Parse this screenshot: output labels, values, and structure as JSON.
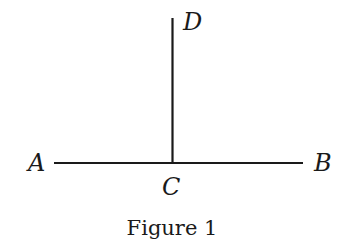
{
  "diagram": {
    "caption": "Figure 1",
    "points": {
      "A": {
        "label": "A",
        "x": 40,
        "y": 171
      },
      "B": {
        "label": "B",
        "x": 322,
        "y": 171
      },
      "C": {
        "label": "C",
        "x": 172,
        "y": 194
      },
      "D": {
        "label": "D",
        "x": 192,
        "y": 30
      }
    },
    "segments": [
      {
        "name": "AB",
        "x1": 54,
        "y1": 163,
        "x2": 303,
        "y2": 163
      },
      {
        "name": "CD",
        "x1": 172,
        "y1": 18,
        "x2": 172,
        "y2": 163
      }
    ],
    "colors": {
      "line": "#1a1a1a",
      "background": "#ffffff"
    }
  }
}
